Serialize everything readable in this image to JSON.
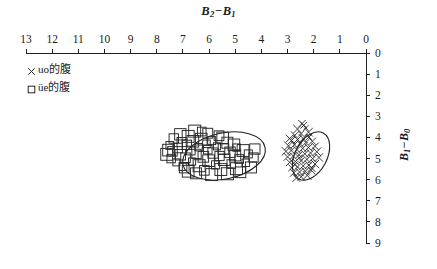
{
  "chart_data": {
    "type": "scatter",
    "title_parts": {
      "lead": "B",
      "lead_sub": "2",
      "dash": "−",
      "trail": "B",
      "trail_sub": "1"
    },
    "xlabel": "B2-B1",
    "ylabel": "B1-B0",
    "ylabel_parts": {
      "lead": "B",
      "lead_sub": "1",
      "dash": "−",
      "trail": "B",
      "trail_sub": "0"
    },
    "x_axis_position": "top",
    "y_axis_position": "right",
    "x_direction": "decreasing-right",
    "y_direction": "increasing-down",
    "xlim": [
      13,
      0
    ],
    "ylim": [
      0,
      9
    ],
    "xticks": [
      13,
      12,
      11,
      10,
      9,
      8,
      7,
      6,
      5,
      4,
      3,
      2,
      1,
      0
    ],
    "yticks": [
      0,
      1,
      2,
      3,
      4,
      5,
      6,
      7,
      8,
      9
    ],
    "grid": false,
    "legend_position": "top-left",
    "series": [
      {
        "name": "×uo的腹",
        "marker": "cross",
        "label_text": "uo的腹",
        "ellipse": {
          "cx": 311,
          "cy": 156,
          "rx": 26,
          "ry": 16,
          "rotation": -62
        },
        "points": [
          [
            2.45,
            3.35
          ],
          [
            2.3,
            3.55
          ],
          [
            2.62,
            3.6
          ],
          [
            2.2,
            3.75
          ],
          [
            2.48,
            3.82
          ],
          [
            2.72,
            3.9
          ],
          [
            2.18,
            3.98
          ],
          [
            2.4,
            4.05
          ],
          [
            2.62,
            4.1
          ],
          [
            2.85,
            4.15
          ],
          [
            2.05,
            4.18
          ],
          [
            2.3,
            4.24
          ],
          [
            2.52,
            4.3
          ],
          [
            2.74,
            4.34
          ],
          [
            2.96,
            4.4
          ],
          [
            1.95,
            4.42
          ],
          [
            2.2,
            4.48
          ],
          [
            2.42,
            4.52
          ],
          [
            2.64,
            4.58
          ],
          [
            2.86,
            4.62
          ],
          [
            3.06,
            4.66
          ],
          [
            1.88,
            4.68
          ],
          [
            2.12,
            4.74
          ],
          [
            2.34,
            4.78
          ],
          [
            2.56,
            4.82
          ],
          [
            2.78,
            4.88
          ],
          [
            3.0,
            4.92
          ],
          [
            1.8,
            4.95
          ],
          [
            2.04,
            5.0
          ],
          [
            2.26,
            5.04
          ],
          [
            2.48,
            5.1
          ],
          [
            2.7,
            5.14
          ],
          [
            2.92,
            5.18
          ],
          [
            1.95,
            5.26
          ],
          [
            2.18,
            5.3
          ],
          [
            2.4,
            5.35
          ],
          [
            2.62,
            5.4
          ],
          [
            2.84,
            5.44
          ],
          [
            2.1,
            5.55
          ],
          [
            2.32,
            5.6
          ],
          [
            2.54,
            5.64
          ],
          [
            2.76,
            5.68
          ],
          [
            2.25,
            5.8
          ],
          [
            2.48,
            5.86
          ],
          [
            2.66,
            5.92
          ],
          [
            2.38,
            3.42
          ],
          [
            2.55,
            4.96
          ],
          [
            2.92,
            4.05
          ],
          [
            2.08,
            5.45
          ],
          [
            2.72,
            5.28
          ]
        ]
      },
      {
        "name": "□üe的腹",
        "marker": "square",
        "label_text": "üe的腹",
        "ellipse": {
          "cx": 224,
          "cy": 156,
          "rx": 42,
          "ry": 23,
          "rotation": -12
        },
        "points": [
          [
            7.1,
            3.85
          ],
          [
            6.55,
            3.7
          ],
          [
            6.05,
            3.8
          ],
          [
            6.8,
            3.95
          ],
          [
            5.62,
            3.92
          ],
          [
            7.35,
            4.05
          ],
          [
            6.3,
            4.08
          ],
          [
            5.9,
            4.15
          ],
          [
            6.62,
            4.18
          ],
          [
            7.05,
            4.22
          ],
          [
            5.3,
            4.25
          ],
          [
            6.1,
            4.3
          ],
          [
            6.85,
            4.35
          ],
          [
            7.5,
            4.38
          ],
          [
            5.7,
            4.42
          ],
          [
            6.4,
            4.46
          ],
          [
            7.2,
            4.5
          ],
          [
            4.95,
            4.48
          ],
          [
            5.45,
            4.55
          ],
          [
            6.05,
            4.58
          ],
          [
            6.7,
            4.62
          ],
          [
            7.4,
            4.66
          ],
          [
            4.7,
            4.62
          ],
          [
            5.2,
            4.7
          ],
          [
            5.85,
            4.74
          ],
          [
            6.48,
            4.78
          ],
          [
            7.1,
            4.82
          ],
          [
            7.62,
            4.8
          ],
          [
            4.5,
            4.78
          ],
          [
            5.0,
            4.85
          ],
          [
            5.6,
            4.88
          ],
          [
            6.22,
            4.92
          ],
          [
            6.9,
            4.96
          ],
          [
            7.45,
            5.0
          ],
          [
            4.3,
            4.95
          ],
          [
            4.85,
            5.02
          ],
          [
            5.42,
            5.06
          ],
          [
            6.02,
            5.1
          ],
          [
            6.65,
            5.14
          ],
          [
            7.25,
            5.18
          ],
          [
            4.6,
            5.2
          ],
          [
            5.15,
            5.26
          ],
          [
            5.75,
            5.3
          ],
          [
            6.38,
            5.34
          ],
          [
            7.0,
            5.38
          ],
          [
            4.4,
            5.42
          ],
          [
            4.95,
            5.48
          ],
          [
            5.55,
            5.52
          ],
          [
            6.18,
            5.56
          ],
          [
            6.8,
            5.6
          ],
          [
            5.3,
            5.72
          ],
          [
            5.9,
            5.76
          ],
          [
            6.5,
            5.7
          ],
          [
            4.8,
            5.65
          ],
          [
            6.95,
            5.45
          ],
          [
            5.05,
            4.35
          ],
          [
            7.55,
            4.6
          ],
          [
            4.25,
            4.55
          ],
          [
            6.28,
            3.72
          ],
          [
            5.48,
            4.02
          ]
        ]
      }
    ],
    "colors": {
      "axis": "#1f1f1f",
      "marker": "#262626",
      "ellipse": "#1f1f1f",
      "text": "#1b1b1b"
    }
  },
  "geometry": {
    "x_axis_y": 53,
    "x_left_px": 26,
    "x_right_px": 366,
    "y_axis_x": 366,
    "y_top_px": 53,
    "y_bottom_px": 243
  }
}
